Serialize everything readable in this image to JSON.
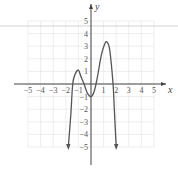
{
  "chart_data": {
    "type": "line",
    "title": "",
    "xlabel": "x",
    "ylabel": "y",
    "xlim": [
      -5,
      5
    ],
    "ylim": [
      -5,
      5
    ],
    "grid": true,
    "x_ticks": [
      "-5",
      "-4",
      "-3",
      "-2",
      "-1",
      "1",
      "2",
      "3",
      "4",
      "5"
    ],
    "y_ticks": [
      "5",
      "4",
      "3",
      "2",
      "1",
      "-1",
      "-2",
      "-3",
      "-4",
      "-5"
    ],
    "series": [
      {
        "name": "polynomial",
        "description": "Even-degree polynomial falling to -infinity at both ends; local max near (-1,1), local min near (0,-1), local max near (1.2,3.3)",
        "points": [
          [
            -1.8,
            -5
          ],
          [
            -1.6,
            -2.4
          ],
          [
            -1.45,
            0
          ],
          [
            -1.25,
            0.8
          ],
          [
            -1,
            1.1
          ],
          [
            -0.8,
            0.6
          ],
          [
            -0.55,
            0
          ],
          [
            -0.3,
            -0.7
          ],
          [
            0,
            -1
          ],
          [
            0.25,
            -0.6
          ],
          [
            0.5,
            0.5
          ],
          [
            0.8,
            2.2
          ],
          [
            1.1,
            3.2
          ],
          [
            1.3,
            3.3
          ],
          [
            1.5,
            2.6
          ],
          [
            1.75,
            0
          ],
          [
            1.85,
            -2
          ],
          [
            2,
            -5
          ]
        ],
        "end_arrows": true
      }
    ]
  }
}
